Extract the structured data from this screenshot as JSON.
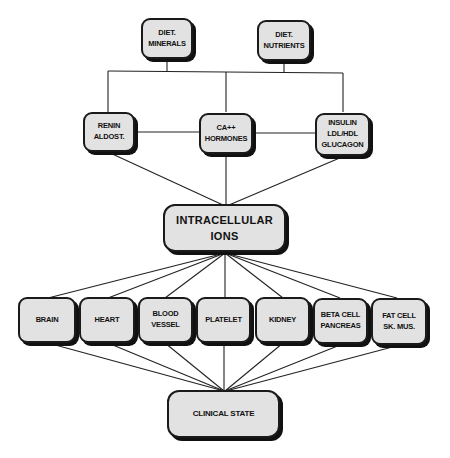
{
  "diagram": {
    "top": [
      {
        "id": "diet_minerals",
        "lines": [
          "DIET.",
          "MINERALS"
        ]
      },
      {
        "id": "diet_nutrients",
        "lines": [
          "DIET.",
          "NUTRIENTS"
        ]
      }
    ],
    "middle": [
      {
        "id": "renin",
        "lines": [
          "RENIN",
          "ALDOST."
        ]
      },
      {
        "id": "ca_hormones",
        "lines": [
          "CA++",
          "HORMONES"
        ]
      },
      {
        "id": "insulin",
        "lines": [
          "INSULIN",
          "LDL/HDL",
          "GLUCAGON"
        ]
      }
    ],
    "center": {
      "id": "intracellular_ions",
      "lines": [
        "INTRACELLULAR",
        "IONS"
      ]
    },
    "organs": [
      {
        "id": "brain",
        "lines": [
          "BRAIN"
        ]
      },
      {
        "id": "heart",
        "lines": [
          "HEART"
        ]
      },
      {
        "id": "blood_vessel",
        "lines": [
          "BLOOD",
          "VESSEL"
        ]
      },
      {
        "id": "platelet",
        "lines": [
          "PLATELET"
        ]
      },
      {
        "id": "kidney",
        "lines": [
          "KIDNEY"
        ]
      },
      {
        "id": "beta_cell",
        "lines": [
          "BETA CELL",
          "PANCREAS"
        ]
      },
      {
        "id": "fat_cell",
        "lines": [
          "FAT CELL",
          "SK. MUS."
        ]
      }
    ],
    "bottom": {
      "id": "clinical_state",
      "lines": [
        "CLINICAL STATE"
      ]
    },
    "edges": [
      [
        "diet_minerals",
        "bus"
      ],
      [
        "diet_nutrients",
        "bus"
      ],
      [
        "bus",
        "renin"
      ],
      [
        "bus",
        "ca_hormones"
      ],
      [
        "bus",
        "insulin"
      ],
      [
        "renin",
        "ca_hormones"
      ],
      [
        "ca_hormones",
        "insulin"
      ],
      [
        "renin",
        "intracellular_ions"
      ],
      [
        "ca_hormones",
        "intracellular_ions"
      ],
      [
        "insulin",
        "intracellular_ions"
      ],
      [
        "intracellular_ions",
        "brain"
      ],
      [
        "intracellular_ions",
        "heart"
      ],
      [
        "intracellular_ions",
        "blood_vessel"
      ],
      [
        "intracellular_ions",
        "platelet"
      ],
      [
        "intracellular_ions",
        "kidney"
      ],
      [
        "intracellular_ions",
        "beta_cell"
      ],
      [
        "intracellular_ions",
        "fat_cell"
      ],
      [
        "brain",
        "clinical_state"
      ],
      [
        "heart",
        "clinical_state"
      ],
      [
        "blood_vessel",
        "clinical_state"
      ],
      [
        "platelet",
        "clinical_state"
      ],
      [
        "kidney",
        "clinical_state"
      ],
      [
        "beta_cell",
        "clinical_state"
      ],
      [
        "fat_cell",
        "clinical_state"
      ]
    ],
    "colors": {
      "box_fill": "#e2e2e2",
      "stroke": "#1a1a1a",
      "background": "#ffffff"
    }
  }
}
